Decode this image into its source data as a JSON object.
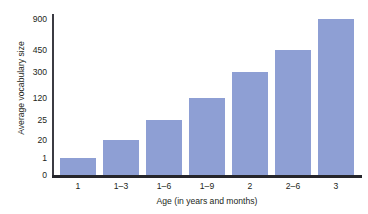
{
  "figure": {
    "top_clipped_text": "",
    "bar_color": "#8e9fd4",
    "axis_color": "#26262b",
    "text_color": "#231f20"
  },
  "chart_data": {
    "type": "bar",
    "title": "",
    "xlabel": "Age (in years and months)",
    "ylabel": "Average vocabulary size",
    "categories": [
      "1",
      "1–3",
      "1–6",
      "1–9",
      "2",
      "2–6",
      "3"
    ],
    "values": [
      1,
      20,
      25,
      120,
      300,
      450,
      900
    ],
    "yticks": [
      0,
      1,
      20,
      25,
      120,
      300,
      450,
      900
    ],
    "ytick_labels": [
      "0",
      "1",
      "20",
      "25",
      "120",
      "300",
      "450",
      "900"
    ],
    "y_scale": "ordinal-compressed",
    "ylim": [
      0,
      900
    ],
    "grid": false,
    "legend": null
  },
  "geometry": {
    "ytick_y": [
      161,
      144,
      126,
      106,
      84,
      58,
      36,
      5
    ],
    "bar_top_y": [
      144,
      126,
      106,
      84,
      58,
      36,
      5
    ],
    "bar_x": [
      8,
      51,
      94,
      137,
      180,
      223,
      266
    ],
    "bar_width": 36,
    "xtick_x": [
      26,
      69,
      112,
      155,
      198,
      241,
      284
    ]
  }
}
